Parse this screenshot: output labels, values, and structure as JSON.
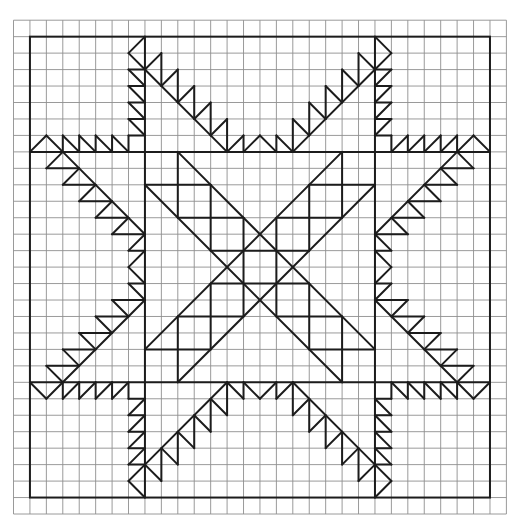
{
  "diagram": {
    "grid": {
      "columns": 30,
      "rows": 30
    },
    "colors": {
      "grid": "#8f8f8f",
      "pattern": "#1c1c1c",
      "background": "#ffffff"
    },
    "frame": {
      "from": [
        1,
        1
      ],
      "to": [
        29,
        29
      ]
    },
    "structure_lines": [
      {
        "name": "band-horizontal-top",
        "from": [
          1,
          8
        ],
        "to": [
          29,
          8
        ]
      },
      {
        "name": "band-horizontal-bottom",
        "from": [
          1,
          22
        ],
        "to": [
          29,
          22
        ]
      },
      {
        "name": "band-vertical-left",
        "from": [
          8,
          1
        ],
        "to": [
          8,
          29
        ]
      },
      {
        "name": "band-vertical-right",
        "from": [
          22,
          1
        ],
        "to": [
          22,
          29
        ]
      }
    ],
    "symmetry": "D4 about grid point (15,15)",
    "arm_octant_segments": [
      [
        [
          8,
          1
        ],
        [
          7,
          2
        ]
      ],
      [
        [
          7,
          2
        ],
        [
          8,
          3
        ]
      ],
      [
        [
          8,
          3
        ],
        [
          13,
          8
        ]
      ],
      [
        [
          8,
          3
        ],
        [
          9,
          2
        ]
      ],
      [
        [
          9,
          2
        ],
        [
          9,
          4
        ]
      ],
      [
        [
          9,
          4
        ],
        [
          10,
          3
        ]
      ],
      [
        [
          10,
          3
        ],
        [
          10,
          5
        ]
      ],
      [
        [
          10,
          5
        ],
        [
          11,
          4
        ]
      ],
      [
        [
          11,
          4
        ],
        [
          11,
          6
        ]
      ],
      [
        [
          11,
          6
        ],
        [
          12,
          5
        ]
      ],
      [
        [
          12,
          5
        ],
        [
          12,
          7
        ]
      ],
      [
        [
          12,
          7
        ],
        [
          13,
          6
        ]
      ],
      [
        [
          13,
          6
        ],
        [
          13,
          8
        ]
      ],
      [
        [
          13,
          8
        ],
        [
          14,
          7
        ]
      ],
      [
        [
          14,
          7
        ],
        [
          14,
          8
        ]
      ],
      [
        [
          14,
          8
        ],
        [
          15,
          7
        ]
      ],
      [
        [
          7,
          3
        ],
        [
          8,
          3
        ]
      ],
      [
        [
          7,
          3
        ],
        [
          8,
          4
        ]
      ],
      [
        [
          7,
          4
        ],
        [
          8,
          4
        ]
      ],
      [
        [
          7,
          4
        ],
        [
          8,
          5
        ]
      ],
      [
        [
          7,
          5
        ],
        [
          8,
          5
        ]
      ],
      [
        [
          7,
          5
        ],
        [
          8,
          6
        ]
      ],
      [
        [
          7,
          6
        ],
        [
          8,
          6
        ]
      ],
      [
        [
          7,
          6
        ],
        [
          8,
          7
        ]
      ],
      [
        [
          7,
          7
        ],
        [
          8,
          7
        ]
      ],
      [
        [
          7,
          7
        ],
        [
          7,
          8
        ]
      ]
    ],
    "center_segments": [
      [
        [
          10,
          8
        ],
        [
          10,
          12
        ]
      ],
      [
        [
          8,
          10
        ],
        [
          12,
          10
        ]
      ],
      [
        [
          10,
          12
        ],
        [
          14,
          12
        ]
      ],
      [
        [
          12,
          10
        ],
        [
          12,
          14
        ]
      ],
      [
        [
          10,
          8
        ],
        [
          22,
          20
        ]
      ],
      [
        [
          8,
          10
        ],
        [
          20,
          22
        ]
      ],
      [
        [
          14,
          12
        ],
        [
          14,
          18
        ]
      ],
      [
        [
          16,
          12
        ],
        [
          16,
          18
        ]
      ],
      [
        [
          12,
          14
        ],
        [
          18,
          14
        ]
      ],
      [
        [
          12,
          16
        ],
        [
          18,
          16
        ]
      ]
    ]
  }
}
